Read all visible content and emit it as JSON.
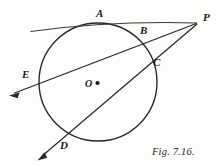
{
  "figure": {
    "caption": "Fig. 7.16.",
    "stroke_color": "#262626",
    "background_color": "#fdfdfc",
    "circle": {
      "cx": 98,
      "cy": 82,
      "r": 59
    },
    "center_point": {
      "label": "O",
      "x": 98,
      "y": 82
    },
    "points": [
      {
        "name": "A",
        "label": "A",
        "x": 101,
        "y": 23
      },
      {
        "name": "B",
        "label": "B",
        "x": 146,
        "y": 38
      },
      {
        "name": "C",
        "label": "C",
        "x": 152,
        "y": 67
      },
      {
        "name": "D",
        "label": "D",
        "x": 73,
        "y": 138
      },
      {
        "name": "E",
        "label": "E",
        "x": 39,
        "y": 84
      },
      {
        "name": "P",
        "label": "P",
        "x": 198,
        "y": 22
      }
    ],
    "lines": [
      {
        "name": "line-AP",
        "from": "A",
        "to": "P",
        "x1": 30,
        "y1": 31,
        "x2": 197,
        "y2": 23,
        "arrow": "none"
      },
      {
        "name": "secant-EP",
        "from": "E-ray",
        "to": "P",
        "x1": 10,
        "y1": 95,
        "x2": 197,
        "y2": 23,
        "arrow": "start"
      },
      {
        "name": "secant-DP",
        "from": "D-ray",
        "to": "P",
        "x1": 38,
        "y1": 160,
        "x2": 197,
        "y2": 24,
        "arrow": "start"
      }
    ]
  }
}
